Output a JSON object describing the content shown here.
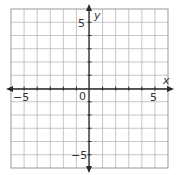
{
  "chart_data": {
    "type": "scatter",
    "title": "",
    "xlabel": "x",
    "ylabel": "y",
    "xlim": [
      -6,
      6
    ],
    "ylim": [
      -6,
      6
    ],
    "grid": true,
    "grid_step": 1,
    "x_tick_labels": [
      {
        "value": -5,
        "label": "−5"
      },
      {
        "value": 5,
        "label": "5"
      }
    ],
    "y_tick_labels": [
      {
        "value": 5,
        "label": "5"
      },
      {
        "value": -5,
        "label": "−5"
      }
    ],
    "origin_label": "0",
    "series": [],
    "colors": {
      "grid": "#b8b8b8",
      "border": "#9a9a9a",
      "axis": "#2a2a2a",
      "text": "#333333"
    }
  },
  "labels": {
    "x_axis": "x",
    "y_axis": "y",
    "origin": "0",
    "x_neg5": "−5",
    "x_pos5": "5",
    "y_pos5": "5",
    "y_neg5": "−5"
  }
}
